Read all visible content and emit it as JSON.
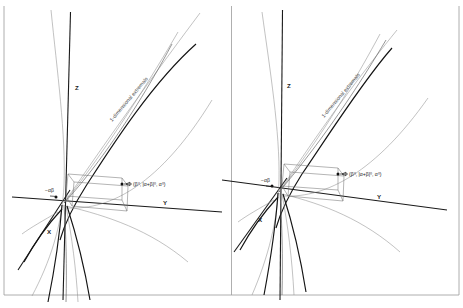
{
  "figure": {
    "caption_present": false,
    "panel_count": 2,
    "background_color": "#ffffff",
    "ink_color": "#1a1a1a"
  },
  "panels": [
    {
      "id": "left-panel",
      "axes": {
        "x_label": "X",
        "y_label": "Y",
        "z_label": "Z"
      },
      "annotations": {
        "extremals_label": "1-dimensional extremals",
        "origin_label": "−αβ",
        "point_label": "(β⁰, |α+β|⁰, α⁰)"
      }
    },
    {
      "id": "right-panel",
      "axes": {
        "x_label": "X",
        "y_label": "Y",
        "z_label": "Z"
      },
      "annotations": {
        "extremals_label": "1-dimensional extremals",
        "origin_label": "−αβ",
        "point_label": "(β⁰, |α+β|⁰, α⁰)"
      }
    }
  ],
  "colors": {
    "curve_dark": "#141414",
    "curve_mid": "#5e5e5e",
    "curve_light": "#8f8f8f",
    "box_edge": "#6b6b6b",
    "frame_rule": "#9a9a9a"
  }
}
